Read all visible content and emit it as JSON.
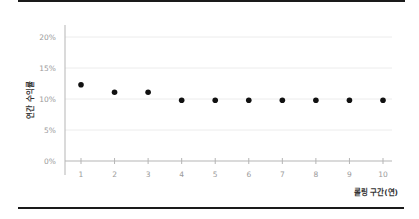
{
  "chart_data": {
    "type": "scatter",
    "title": "",
    "xlabel": "롤링 구간(연)",
    "ylabel": "연간 수익률",
    "x": [
      1,
      2,
      3,
      4,
      5,
      6,
      7,
      8,
      9,
      10
    ],
    "x_tick_labels": [
      "1",
      "2",
      "3",
      "4",
      "5",
      "6",
      "7",
      "8",
      "9",
      "10"
    ],
    "y_tick_labels": [
      "0%",
      "5%",
      "10%",
      "15%",
      "20%"
    ],
    "y_ticks": [
      0,
      5,
      10,
      15,
      20
    ],
    "series": [
      {
        "name": "연간 수익률",
        "values": [
          12.3,
          11.1,
          11.1,
          9.8,
          9.8,
          9.8,
          9.8,
          9.8,
          9.8,
          9.8
        ]
      }
    ],
    "ylim": [
      0,
      20
    ],
    "xlim": [
      0.5,
      10.3
    ],
    "grid": true,
    "legend": "none",
    "colors": {
      "point": "#111111",
      "grid": "#ececec",
      "axis": "#b5b5b5",
      "tick_text": "#9a9a9a",
      "rule": "#1a1a1a"
    }
  }
}
